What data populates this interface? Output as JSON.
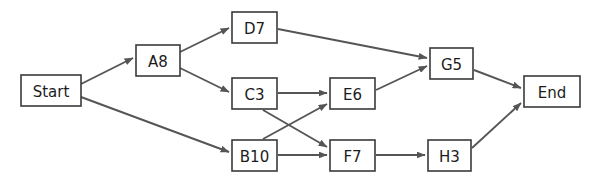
{
  "diagram": {
    "background_color": "#ffffff",
    "node_fill": "#ffffff",
    "node_border_color": "#3a3a3a",
    "edge_color": "#555555",
    "label_color": "#1c1c1c",
    "nodes": [
      {
        "id": "start",
        "label": "Start",
        "x": 21,
        "y": 75,
        "w": 60,
        "h": 31
      },
      {
        "id": "a8",
        "label": "A8",
        "x": 136,
        "y": 45,
        "w": 44,
        "h": 31
      },
      {
        "id": "d7",
        "label": "D7",
        "x": 232,
        "y": 12,
        "w": 45,
        "h": 31
      },
      {
        "id": "c3",
        "label": "C3",
        "x": 232,
        "y": 78,
        "w": 45,
        "h": 31
      },
      {
        "id": "b10",
        "label": "B10",
        "x": 232,
        "y": 140,
        "w": 45,
        "h": 31
      },
      {
        "id": "e6",
        "label": "E6",
        "x": 330,
        "y": 78,
        "w": 45,
        "h": 31
      },
      {
        "id": "f7",
        "label": "F7",
        "x": 330,
        "y": 140,
        "w": 45,
        "h": 31
      },
      {
        "id": "g5",
        "label": "G5",
        "x": 430,
        "y": 48,
        "w": 43,
        "h": 31
      },
      {
        "id": "h3",
        "label": "H3",
        "x": 428,
        "y": 140,
        "w": 43,
        "h": 31
      },
      {
        "id": "end",
        "label": "End",
        "x": 524,
        "y": 76,
        "w": 56,
        "h": 31
      }
    ],
    "edges": [
      {
        "id": "start-a8",
        "from": "Start",
        "to": "A8",
        "x1": 81,
        "y1": 84,
        "x2": 133,
        "y2": 58
      },
      {
        "id": "start-b10",
        "from": "Start",
        "to": "B10",
        "x1": 81,
        "y1": 97,
        "x2": 229,
        "y2": 152
      },
      {
        "id": "a8-d7",
        "from": "A8",
        "to": "D7",
        "x1": 180,
        "y1": 52,
        "x2": 229,
        "y2": 28
      },
      {
        "id": "a8-c3",
        "from": "A8",
        "to": "C3",
        "x1": 180,
        "y1": 68,
        "x2": 229,
        "y2": 92
      },
      {
        "id": "d7-g5",
        "from": "D7",
        "to": "G5",
        "x1": 278,
        "y1": 29,
        "x2": 427,
        "y2": 58
      },
      {
        "id": "c3-e6",
        "from": "C3",
        "to": "E6",
        "x1": 278,
        "y1": 93,
        "x2": 327,
        "y2": 93
      },
      {
        "id": "c3-f7",
        "from": "C3",
        "to": "F7",
        "x1": 263,
        "y1": 110,
        "x2": 327,
        "y2": 147
      },
      {
        "id": "b10-e6",
        "from": "B10",
        "to": "E6",
        "x1": 263,
        "y1": 139,
        "x2": 327,
        "y2": 104
      },
      {
        "id": "b10-f7",
        "from": "B10",
        "to": "F7",
        "x1": 278,
        "y1": 155,
        "x2": 327,
        "y2": 155
      },
      {
        "id": "e6-g5",
        "from": "E6",
        "to": "G5",
        "x1": 376,
        "y1": 90,
        "x2": 427,
        "y2": 66
      },
      {
        "id": "f7-h3",
        "from": "F7",
        "to": "H3",
        "x1": 376,
        "y1": 155,
        "x2": 425,
        "y2": 155
      },
      {
        "id": "g5-end",
        "from": "G5",
        "to": "End",
        "x1": 474,
        "y1": 70,
        "x2": 521,
        "y2": 88
      },
      {
        "id": "h3-end",
        "from": "H3",
        "to": "End",
        "x1": 472,
        "y1": 148,
        "x2": 521,
        "y2": 103
      }
    ]
  }
}
